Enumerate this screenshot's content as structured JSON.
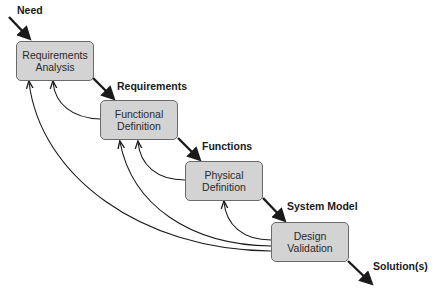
{
  "diagram": {
    "type": "waterfall process with feedback loops",
    "boxes": [
      {
        "id": "requirements-analysis",
        "line1": "Requirements",
        "line2": "Analysis"
      },
      {
        "id": "functional-definition",
        "line1": "Functional",
        "line2": "Definition"
      },
      {
        "id": "physical-definition",
        "line1": "Physical",
        "line2": "Definition"
      },
      {
        "id": "design-validation",
        "line1": "Design",
        "line2": "Validation"
      }
    ],
    "flow_labels": {
      "input": "Need",
      "after_analysis": "Requirements",
      "after_functional": "Functions",
      "after_physical": "System Model",
      "output": "Solution(s)"
    },
    "colors": {
      "box_fill": "#d3d3d3",
      "box_border": "#6a6a6a",
      "arrow": "#1a1a1a"
    }
  }
}
